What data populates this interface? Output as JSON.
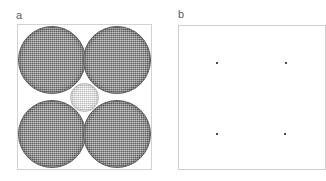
{
  "figure": {
    "caption_labels": {
      "panel_a": "a",
      "panel_b": "b"
    }
  },
  "panel_a": {
    "label": "a",
    "frame_color": "#d2d2d2",
    "background_color": "#ffffff",
    "spheres": [
      {
        "id": "top-left",
        "type": "large",
        "fill": "#8b8b8b",
        "cx": 34,
        "cy": 35,
        "r": 34,
        "texture": "fine-grid"
      },
      {
        "id": "top-right",
        "type": "large",
        "fill": "#8b8b8b",
        "cx": 99,
        "cy": 35,
        "r": 34,
        "texture": "fine-grid"
      },
      {
        "id": "bottom-left",
        "type": "large",
        "fill": "#8b8b8b",
        "cx": 34,
        "cy": 109,
        "r": 34,
        "texture": "fine-grid"
      },
      {
        "id": "bottom-right",
        "type": "large",
        "fill": "#8b8b8b",
        "cx": 99,
        "cy": 109,
        "r": 34,
        "texture": "fine-grid"
      },
      {
        "id": "center",
        "type": "small",
        "fill": "#dbdbdb",
        "cx": 66,
        "cy": 72,
        "r": 14,
        "texture": "fine-grid"
      }
    ]
  },
  "panel_b": {
    "label": "b",
    "frame_color": "#cfcfcf",
    "background_color": "#ffffff",
    "point_color": "#4a4a4a",
    "points": [
      {
        "id": "top-left",
        "x": 38,
        "y": 37
      },
      {
        "id": "top-right",
        "x": 107,
        "y": 37
      },
      {
        "id": "bottom-left",
        "x": 38,
        "y": 108
      },
      {
        "id": "bottom-right",
        "x": 106,
        "y": 108
      }
    ]
  },
  "chart_data": {
    "type": "scatter",
    "title": "",
    "xlabel": "",
    "ylabel": "",
    "panels": [
      {
        "label": "a",
        "description": "Square cell packed with four large equal circles in a 2x2 touching arrangement plus one small circle in the central interstice",
        "type": "scatter",
        "xlim": [
          0,
          135
        ],
        "ylim": [
          0,
          146
        ],
        "grid": false,
        "legend": "none",
        "series": [
          {
            "name": "large circles",
            "marker": "circle",
            "radius": 34,
            "fill": "#8b8b8b",
            "x": [
              34,
              99,
              34,
              99
            ],
            "y": [
              35,
              35,
              109,
              109
            ]
          },
          {
            "name": "interstitial circle",
            "marker": "circle",
            "radius": 14,
            "fill": "#dbdbdb",
            "x": [
              66
            ],
            "y": [
              72
            ]
          }
        ]
      },
      {
        "label": "b",
        "description": "Same square cell showing only the four circle centres as point markers",
        "type": "scatter",
        "xlim": [
          0,
          148
        ],
        "ylim": [
          0,
          145
        ],
        "grid": false,
        "legend": "none",
        "series": [
          {
            "name": "circle centres",
            "marker": "point",
            "radius": 1,
            "fill": "#4a4a4a",
            "x": [
              38,
              107,
              38,
              106
            ],
            "y": [
              37,
              37,
              108,
              108
            ]
          }
        ]
      }
    ]
  }
}
